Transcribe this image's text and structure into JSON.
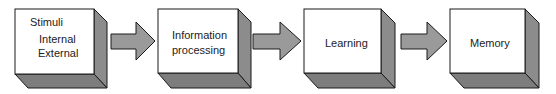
{
  "diagram": {
    "type": "flowchart",
    "direction": "left-to-right",
    "colors": {
      "box_front": "#ffffff",
      "box_side": "#8c8c8c",
      "box_bottom": "#7d7d7d",
      "arrow_fill": "#9a9a9a",
      "outline": "#1a1a1a"
    },
    "nodes": [
      {
        "id": "stimuli",
        "title": "Stimuli",
        "lines": [
          "Internal",
          "External"
        ]
      },
      {
        "id": "information-processing",
        "lines": [
          "Information",
          "processing"
        ]
      },
      {
        "id": "learning",
        "lines": [
          "Learning"
        ]
      },
      {
        "id": "memory",
        "lines": [
          "Memory"
        ]
      }
    ],
    "edges": [
      {
        "from": "stimuli",
        "to": "information-processing"
      },
      {
        "from": "information-processing",
        "to": "learning"
      },
      {
        "from": "learning",
        "to": "memory"
      }
    ]
  }
}
